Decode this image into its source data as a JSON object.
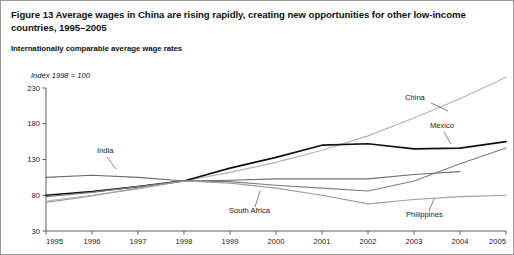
{
  "figure": {
    "title": "Figure 13  Average wages in China are rising rapidly, creating new opportunities for other low-income countries, 1995–2005",
    "subtitle": "Internationally comparable average wage rates",
    "axis_note": "Index 1998 = 100"
  },
  "chart_data": {
    "type": "line",
    "title": "Figure 13  Average wages in China are rising rapidly, creating new opportunities for other low-income countries, 1995–2005",
    "subtitle": "Internationally comparable average wage rates",
    "xlabel": "",
    "ylabel": "Index 1998 = 100",
    "x": [
      1995,
      1996,
      1997,
      1998,
      1999,
      2000,
      2001,
      2002,
      2003,
      2004,
      2005
    ],
    "xtick_labels": [
      "1995",
      "1996",
      "1997",
      "1998",
      "1999",
      "2000",
      "2001",
      "2002",
      "2003",
      "2004",
      "2005"
    ],
    "ytick_labels": [
      "30",
      "80",
      "130",
      "180",
      "230"
    ],
    "yticks": [
      30,
      80,
      130,
      180,
      230
    ],
    "ylim": [
      30,
      235
    ],
    "xlim": [
      1995,
      2005
    ],
    "grid": false,
    "legend": "inline-labels",
    "series": [
      {
        "name": "China",
        "color": "#b4b4b4",
        "width": 1.15,
        "x": [
          1995,
          1996,
          1997,
          1998,
          1999,
          2000,
          2001,
          2002,
          2003,
          2004,
          2005
        ],
        "values": [
          72,
          80,
          89,
          100,
          112,
          126,
          143,
          163,
          188,
          215,
          245
        ],
        "label": "China",
        "label_x": 404,
        "label_y": 99,
        "leader": [
          [
            430,
            102
          ],
          [
            447,
            110
          ]
        ]
      },
      {
        "name": "Mexico",
        "color": "#111111",
        "width": 1.7,
        "x": [
          1995,
          1996,
          1997,
          1998,
          1999,
          2000,
          2001,
          2002,
          2003,
          2004,
          2005
        ],
        "values": [
          80,
          85,
          92,
          100,
          118,
          133,
          150,
          152,
          145,
          146,
          155
        ],
        "label": "Mexico",
        "label_x": 429,
        "label_y": 127,
        "leader": [
          [
            443,
            131
          ],
          [
            450,
            143
          ]
        ]
      },
      {
        "name": "India",
        "color": "#6e6e6e",
        "width": 1.15,
        "x": [
          1995,
          1996,
          1997,
          1998,
          1999,
          2000,
          2001,
          2002,
          2003,
          2004
        ],
        "values": [
          105,
          108,
          105,
          100,
          101,
          103,
          103,
          103,
          109,
          113
        ],
        "label": "India",
        "label_x": 96,
        "label_y": 152,
        "leader": [
          [
            106,
            156
          ],
          [
            115,
            168
          ]
        ]
      },
      {
        "name": "South Africa",
        "color": "#7d7d7d",
        "width": 1.15,
        "x": [
          1995,
          1996,
          1997,
          1998,
          1999,
          2000,
          2001,
          2002,
          2003,
          2004,
          2005
        ],
        "values": [
          78,
          84,
          92,
          100,
          99,
          94,
          90,
          86,
          100,
          124,
          146
        ],
        "label": "South Africa",
        "label_x": 228,
        "label_y": 212,
        "leader": [
          [
            254,
            206
          ],
          [
            259,
            190
          ]
        ]
      },
      {
        "name": "Philippines",
        "color": "#9d9d9d",
        "width": 1.15,
        "x": [
          1995,
          1996,
          1997,
          1998,
          1999,
          2000,
          2001,
          2002,
          2003,
          2004,
          2005
        ],
        "values": [
          70,
          79,
          90,
          100,
          97,
          90,
          80,
          68,
          74,
          78,
          80
        ],
        "label": "Philippines",
        "label_x": 405,
        "label_y": 216,
        "leader": [
          [
            428,
            210
          ],
          [
            433,
            198
          ]
        ]
      }
    ]
  }
}
